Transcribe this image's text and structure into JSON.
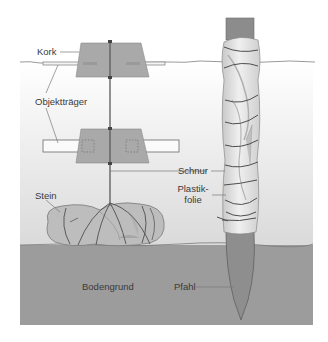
{
  "figure": {
    "labels": {
      "kork": "Kork",
      "objekttraeger": "Objektträger",
      "stein": "Stein",
      "schnur": "Schnur",
      "plastikfolie_line1": "Plastik-",
      "plastikfolie_line2": "folie",
      "bodengrund": "Bodengrund",
      "pfahl": "Pfahl"
    },
    "colors": {
      "water_top": "#ffffff",
      "water_bottom": "#dcdcdc",
      "ground": "#9c9c9c",
      "cork": "#a8a8a8",
      "stake": "#8e8e8e",
      "string": "#5a5a5a",
      "foil": "#e2e2e2",
      "stone": "#bdbdbd",
      "label_text": "#3a3a3a",
      "leader_line": "#7a7a7a"
    }
  }
}
